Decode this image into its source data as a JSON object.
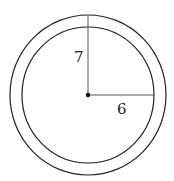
{
  "diagram": {
    "type": "concentric-circles",
    "outer_radius_label": "7",
    "inner_radius_label": "6",
    "colors": {
      "stroke": "#222222",
      "background": "#ffffff"
    }
  }
}
